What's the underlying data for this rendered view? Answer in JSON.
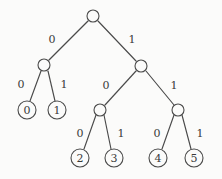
{
  "diagram": {
    "type": "binary-tree",
    "background_color": "#fbfbfa",
    "stroke_color": "#4a4a4a",
    "text_color": "#3a3a3a",
    "nodes": [
      {
        "id": "root",
        "label": "",
        "kind": "internal",
        "cx": 93,
        "cy": 16,
        "r": 6
      },
      {
        "id": "n0",
        "label": "",
        "kind": "internal",
        "cx": 44,
        "cy": 65,
        "r": 6
      },
      {
        "id": "n1",
        "label": "",
        "kind": "internal",
        "cx": 141,
        "cy": 66,
        "r": 6
      },
      {
        "id": "n10",
        "label": "",
        "kind": "internal",
        "cx": 100,
        "cy": 110,
        "r": 6
      },
      {
        "id": "n11",
        "label": "",
        "kind": "internal",
        "cx": 178,
        "cy": 110,
        "r": 6
      },
      {
        "id": "leaf0",
        "label": "0",
        "kind": "leaf",
        "cx": 27,
        "cy": 110,
        "r": 9
      },
      {
        "id": "leaf1",
        "label": "1",
        "kind": "leaf",
        "cx": 57,
        "cy": 110,
        "r": 9
      },
      {
        "id": "leaf2",
        "label": "2",
        "kind": "leaf",
        "cx": 80,
        "cy": 158,
        "r": 9
      },
      {
        "id": "leaf3",
        "label": "3",
        "kind": "leaf",
        "cx": 114,
        "cy": 158,
        "r": 9
      },
      {
        "id": "leaf4",
        "label": "4",
        "kind": "leaf",
        "cx": 158,
        "cy": 158,
        "r": 9
      },
      {
        "id": "leaf5",
        "label": "5",
        "kind": "leaf",
        "cx": 194,
        "cy": 158,
        "r": 9
      }
    ],
    "edges": [
      {
        "id": "e-root-n0",
        "from": "root",
        "to": "n0",
        "label": "0",
        "x1": 88,
        "y1": 21,
        "x2": 49,
        "y2": 60,
        "lx": 52,
        "ly": 39
      },
      {
        "id": "e-root-n1",
        "from": "root",
        "to": "n1",
        "label": "1",
        "x1": 98,
        "y1": 21,
        "x2": 136,
        "y2": 61,
        "lx": 132,
        "ly": 39
      },
      {
        "id": "e-n0-leaf0",
        "from": "n0",
        "to": "leaf0",
        "label": "0",
        "x1": 41,
        "y1": 71,
        "x2": 30,
        "y2": 101,
        "lx": 21,
        "ly": 84
      },
      {
        "id": "e-n0-leaf1",
        "from": "n0",
        "to": "leaf1",
        "label": "1",
        "x1": 48,
        "y1": 71,
        "x2": 55,
        "y2": 101,
        "lx": 64,
        "ly": 84
      },
      {
        "id": "e-n1-n10",
        "from": "n1",
        "to": "n10",
        "label": "0",
        "x1": 136,
        "y1": 71,
        "x2": 105,
        "y2": 105,
        "lx": 106,
        "ly": 85
      },
      {
        "id": "e-n1-n11",
        "from": "n1",
        "to": "n11",
        "label": "1",
        "x1": 146,
        "y1": 71,
        "x2": 174,
        "y2": 105,
        "lx": 174,
        "ly": 85
      },
      {
        "id": "e-n10-leaf2",
        "from": "n10",
        "to": "leaf2",
        "label": "0",
        "x1": 96,
        "y1": 115,
        "x2": 84,
        "y2": 149,
        "lx": 80,
        "ly": 133
      },
      {
        "id": "e-n10-leaf3",
        "from": "n10",
        "to": "leaf3",
        "label": "1",
        "x1": 104,
        "y1": 115,
        "x2": 111,
        "y2": 149,
        "lx": 121,
        "ly": 133
      },
      {
        "id": "e-n11-leaf4",
        "from": "n11",
        "to": "leaf4",
        "label": "0",
        "x1": 174,
        "y1": 115,
        "x2": 162,
        "y2": 149,
        "lx": 157,
        "ly": 133
      },
      {
        "id": "e-n11-leaf5",
        "from": "n11",
        "to": "leaf5",
        "label": "1",
        "x1": 182,
        "y1": 115,
        "x2": 191,
        "y2": 149,
        "lx": 200,
        "ly": 133
      }
    ]
  }
}
